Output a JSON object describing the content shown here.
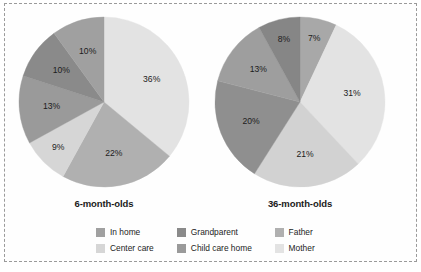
{
  "colors": {
    "in_home": "#a0a0a0",
    "center_care": "#d6d6d6",
    "grandparent": "#8a8a8a",
    "child_care_home": "#9a9a9a",
    "father": "#b0b0b0",
    "mother": "#e3e3e3",
    "text": "#1c1c1c",
    "frame_border": "#9a9a9a",
    "background": "#ffffff"
  },
  "legend": {
    "rows": [
      [
        {
          "label": "In home",
          "color_key": "in_home",
          "color": "#a0a0a0"
        },
        {
          "label": "Grandparent",
          "color_key": "grandparent",
          "color": "#8a8a8a"
        },
        {
          "label": "Father",
          "color_key": "father",
          "color": "#b0b0b0"
        }
      ],
      [
        {
          "label": "Center care",
          "color_key": "center_care",
          "color": "#d6d6d6"
        },
        {
          "label": "Child care home",
          "color_key": "child_care_home",
          "color": "#9a9a9a"
        },
        {
          "label": "Mother",
          "color_key": "mother",
          "color": "#e3e3e3"
        }
      ]
    ]
  },
  "chart_data": [
    {
      "type": "pie",
      "title": "6-month-olds",
      "categories": [
        "Mother",
        "Father",
        "Center care",
        "Child care home",
        "Grandparent",
        "In home"
      ],
      "values": [
        36,
        22,
        9,
        13,
        10,
        10
      ],
      "labels": [
        "36%",
        "22%",
        "9%",
        "13%",
        "10%",
        "10%"
      ],
      "colors": [
        "#e3e3e3",
        "#b0b0b0",
        "#d6d6d6",
        "#9a9a9a",
        "#8a8a8a",
        "#a0a0a0"
      ],
      "start_angle_deg": 0,
      "direction": "clockwise",
      "legend_position": "bottom",
      "grid": false
    },
    {
      "type": "pie",
      "title": "36-month-olds",
      "categories": [
        "In home",
        "Mother",
        "Father",
        "Child care home",
        "Grandparent",
        "Center care"
      ],
      "values": [
        7,
        31,
        21,
        20,
        13,
        8
      ],
      "labels": [
        "7%",
        "31%",
        "21%",
        "20%",
        "13%",
        "8%"
      ],
      "colors": [
        "#a8a8a8",
        "#e3e3e3",
        "#d2d2d2",
        "#8f8f8f",
        "#9e9e9e",
        "#868686"
      ],
      "start_angle_deg": 0,
      "direction": "clockwise",
      "legend_position": "bottom",
      "grid": false
    }
  ]
}
